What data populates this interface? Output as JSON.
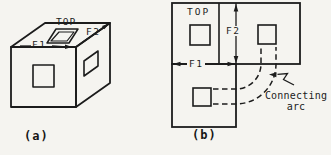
{
  "figure": {
    "colors": {
      "ink": "#1c1c1c",
      "background": "#f5f4f0"
    },
    "panel_a": {
      "caption": "(a)",
      "top_label": "TOP",
      "f1_label": "F1",
      "f2_label": "F2"
    },
    "panel_b": {
      "caption": "(b)",
      "top_label": "TOP",
      "f1_label": "F1",
      "f2_label": "F2",
      "annotation_line1": "Connecting",
      "annotation_line2": "arc"
    }
  }
}
